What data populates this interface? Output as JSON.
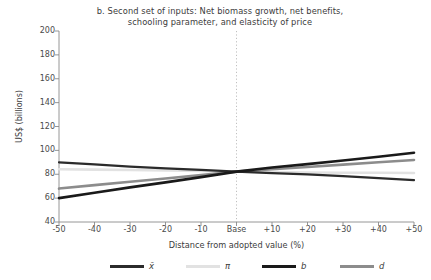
{
  "chart_data": {
    "type": "line",
    "title": "b. Second set of inputs: Net biomass growth, net benefits, schooling parameter, and elasticity of price",
    "title_line1": "b. Second set of inputs: Net biomass growth, net benefits,",
    "title_line2": "schooling parameter, and elasticity of price",
    "xlabel": "Distance from adopted value (%)",
    "ylabel": "US$ (billions)",
    "xlim": [
      -50,
      50
    ],
    "ylim": [
      40,
      200
    ],
    "yticks": [
      200,
      180,
      160,
      140,
      120,
      100,
      80,
      60,
      40
    ],
    "xticks": [
      -50,
      -40,
      -30,
      -20,
      -10,
      0,
      10,
      20,
      30,
      40,
      50
    ],
    "xticklabels": [
      "-50",
      "-40",
      "-30",
      "-20",
      "-10",
      "Base",
      "+10",
      "+20",
      "+30",
      "+40",
      "+50"
    ],
    "x": [
      -50,
      -40,
      -30,
      -20,
      -10,
      0,
      10,
      20,
      30,
      40,
      50
    ],
    "grid": false,
    "legend_position": "bottom",
    "reference_line": {
      "x": 0,
      "label": "Base",
      "style": "dotted",
      "color": "#b9b9b9"
    },
    "series": [
      {
        "name": "x-bar",
        "label": "x̄",
        "color": "#2b2b2b",
        "width": 2.2,
        "values": [
          90.0,
          88.2,
          86.4,
          85.0,
          83.6,
          82.2,
          81.0,
          79.9,
          78.4,
          76.8,
          75.0
        ]
      },
      {
        "name": "pi",
        "label": "π",
        "color": "#e2e2e2",
        "width": 2.6,
        "values": [
          84.2,
          83.9,
          83.6,
          83.2,
          82.8,
          82.2,
          81.8,
          81.5,
          81.3,
          81.2,
          81.1
        ]
      },
      {
        "name": "b",
        "label": "b",
        "color": "#1a1a1a",
        "width": 2.6,
        "values": [
          60.0,
          64.5,
          69.0,
          73.2,
          77.6,
          82.2,
          85.6,
          88.5,
          91.5,
          94.6,
          98.0
        ]
      },
      {
        "name": "d",
        "label": "d",
        "color": "#8c8c8c",
        "width": 2.6,
        "values": [
          68.0,
          70.9,
          73.7,
          76.5,
          79.3,
          82.2,
          84.2,
          86.1,
          88.1,
          90.0,
          92.0
        ]
      }
    ]
  },
  "legend": {
    "items": [
      {
        "label": "x̄",
        "color": "#2b2b2b"
      },
      {
        "label": "π",
        "color": "#e2e2e2"
      },
      {
        "label": "b",
        "color": "#1a1a1a"
      },
      {
        "label": "d",
        "color": "#8c8c8c"
      }
    ]
  },
  "axes": {
    "axis_color": "#8a8a8a",
    "tick_color": "#4a4a4a"
  }
}
